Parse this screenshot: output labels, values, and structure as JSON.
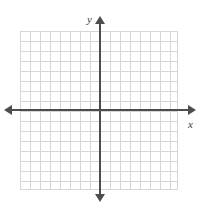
{
  "chart_data": {
    "type": "scatter",
    "title": "",
    "subtitle": "",
    "xlabel": "x",
    "ylabel": "y",
    "xlim": [
      -8,
      8
    ],
    "ylim": [
      -8,
      8
    ],
    "x_major_step": 1,
    "y_major_step": 1,
    "grid": true,
    "grid_columns": 16,
    "grid_rows": 16,
    "tick_labels_x": [],
    "tick_labels_y": [],
    "legend": [],
    "annotations": [],
    "series": [],
    "x": [],
    "values": [],
    "origin_label": "",
    "axis_arrows": [
      "left",
      "right",
      "up",
      "down"
    ]
  },
  "plot": {
    "y_axis_label": "y",
    "x_axis_label": "x",
    "colors": {
      "grid_line": "#d6d6d6",
      "axis": "#4d4d4d",
      "label": "#3a3a3a",
      "background": "#ffffff"
    }
  }
}
